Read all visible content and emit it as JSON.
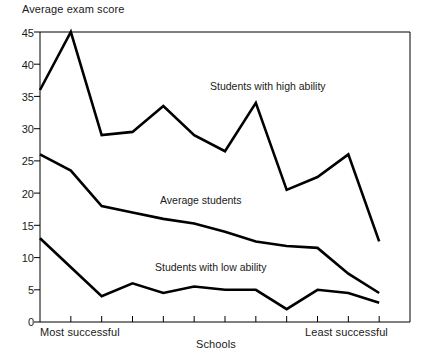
{
  "chart_data": {
    "type": "line",
    "title": "",
    "ylabel": "Average exam score",
    "xlabel": "Schools",
    "ylim": [
      0,
      45
    ],
    "yticks": [
      0,
      5,
      10,
      15,
      20,
      25,
      30,
      35,
      40,
      45
    ],
    "grid": false,
    "legend_position": "inline-annotations",
    "x_axis_left_label": "Most successful",
    "x_axis_right_label": "Least successful",
    "x": [
      1,
      2,
      3,
      4,
      5,
      6,
      7,
      8,
      9,
      10,
      11,
      12
    ],
    "n_x_intervals": 12,
    "series": [
      {
        "name": "Students with high ability",
        "values": [
          36,
          45,
          29,
          29.5,
          33.5,
          29,
          26.5,
          34,
          20.5,
          22.5,
          26,
          12.5
        ]
      },
      {
        "name": "Average students",
        "values": [
          26,
          23.5,
          18,
          17,
          16,
          15.3,
          14,
          12.5,
          11.8,
          11.5,
          7.5,
          4.5
        ]
      },
      {
        "name": "Students with low ability",
        "values": [
          13,
          8.5,
          4,
          6,
          4.5,
          5.5,
          5,
          5,
          2,
          5,
          4.5,
          3
        ]
      }
    ]
  },
  "labels": {
    "y_axis_title": "Average exam score",
    "x_axis_title": "Schools",
    "x_left": "Most successful",
    "x_right": "Least successful",
    "series_high": "Students with high ability",
    "series_average": "Average students",
    "series_low": "Students with low ability",
    "tick_0": "0",
    "tick_5": "5",
    "tick_10": "10",
    "tick_15": "15",
    "tick_20": "20",
    "tick_25": "25",
    "tick_30": "30",
    "tick_35": "35",
    "tick_40": "40",
    "tick_45": "45"
  },
  "colors": {
    "line": "#000000",
    "axis": "#000000",
    "background": "#ffffff",
    "text": "#1a1a1a"
  }
}
